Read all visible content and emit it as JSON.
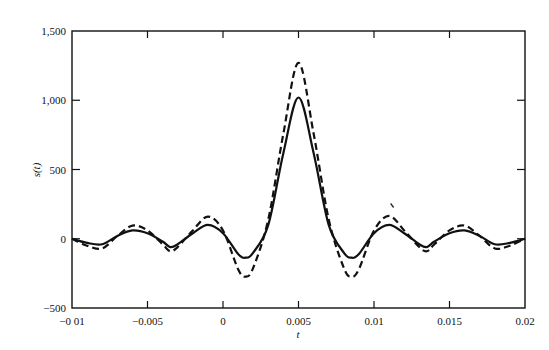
{
  "chart_data": {
    "type": "line",
    "title": "",
    "xlabel": "t",
    "ylabel": "s(t)",
    "xlim": [
      -0.01,
      0.02
    ],
    "ylim": [
      -500,
      1500
    ],
    "grid": false,
    "legend": null,
    "x_ticks": [
      -0.01,
      -0.005,
      0,
      0.005,
      0.01,
      0.015,
      0.02
    ],
    "x_tick_labels": [
      "−0 01",
      "−0.005",
      "0",
      "0.005",
      "0.01",
      "0.015",
      "0.02"
    ],
    "y_ticks": [
      -500,
      0,
      500,
      1000,
      1500
    ],
    "y_tick_labels": [
      "−500",
      "0",
      "500",
      "1,000",
      "1,500"
    ],
    "x": [
      -0.01,
      -0.009,
      -0.008,
      -0.007,
      -0.006,
      -0.005,
      -0.004,
      -0.0035,
      -0.003,
      -0.002,
      -0.001,
      0,
      0.001,
      0.0015,
      0.002,
      0.003,
      0.004,
      0.005,
      0.006,
      0.007,
      0.008,
      0.0085,
      0.009,
      0.01,
      0.011,
      0.012,
      0.013,
      0.0135,
      0.014,
      0.015,
      0.016,
      0.017,
      0.018,
      0.019,
      0.02
    ],
    "series": [
      {
        "name": "solid",
        "style": "solid",
        "values": [
          0,
          -30,
          -40,
          20,
          60,
          40,
          -20,
          -60,
          -40,
          40,
          100,
          40,
          -110,
          -137,
          -100,
          100,
          620,
          1020,
          620,
          100,
          -100,
          -137,
          -110,
          40,
          100,
          40,
          -40,
          -60,
          -20,
          40,
          60,
          20,
          -40,
          -30,
          0
        ]
      },
      {
        "name": "dashed",
        "style": "dashed",
        "values": [
          0,
          -50,
          -70,
          20,
          95,
          60,
          -40,
          -90,
          -60,
          60,
          160,
          60,
          -220,
          -274,
          -210,
          140,
          760,
          1270,
          760,
          140,
          -210,
          -274,
          -220,
          60,
          165,
          60,
          -60,
          -90,
          -40,
          60,
          95,
          20,
          -70,
          -50,
          0
        ]
      }
    ]
  },
  "annotations": [
    {
      "type": "stray-mark",
      "x": 0.0112,
      "y": 240
    }
  ]
}
